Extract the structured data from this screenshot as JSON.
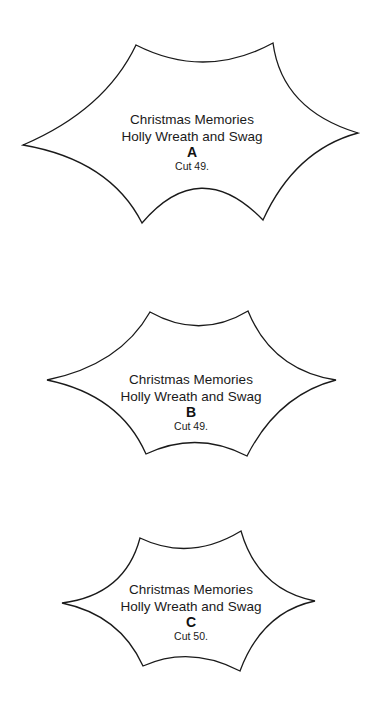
{
  "pieces": [
    {
      "title": "Christmas Memories",
      "subtitle": "Holly Wreath and Swag",
      "letter": "A",
      "cut": "Cut 49."
    },
    {
      "title": "Christmas Memories",
      "subtitle": "Holly Wreath and Swag",
      "letter": "B",
      "cut": "Cut 49."
    },
    {
      "title": "Christmas Memories",
      "subtitle": "Holly Wreath and Swag",
      "letter": "C",
      "cut": "Cut 50."
    }
  ],
  "colors": {
    "outline": "#1a1a1a",
    "fill": "#ffffff"
  }
}
